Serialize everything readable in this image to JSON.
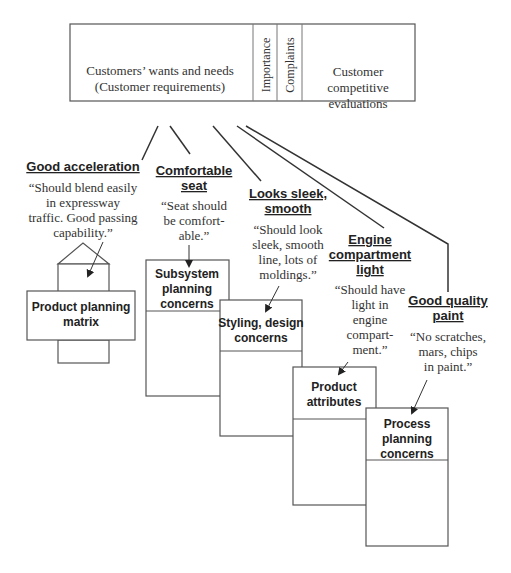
{
  "header_table": {
    "requirements_label_line1": "Customers’ wants and needs",
    "requirements_label_line2": "(Customer requirements)",
    "importance_label": "Importance",
    "complaints_label": "Complaints",
    "evaluations_line1": "Customer",
    "evaluations_line2": "competitive",
    "evaluations_line3": "evaluations"
  },
  "requirements": [
    {
      "title_lines": [
        "Good acceleration"
      ],
      "quote_lines": [
        "“Should blend easily",
        "in expressway",
        "traffic. Good passing",
        "capability.”"
      ]
    },
    {
      "title_lines": [
        "Comfortable",
        "seat"
      ],
      "quote_lines": [
        "“Seat should",
        "be comfort-",
        "able.”"
      ]
    },
    {
      "title_lines": [
        "Looks sleek,",
        "smooth"
      ],
      "quote_lines": [
        "“Should look",
        "sleek, smooth",
        "line, lots of",
        "moldings.”"
      ]
    },
    {
      "title_lines": [
        "Engine",
        "compartment",
        "light"
      ],
      "quote_lines": [
        "“Should have",
        "light in",
        "engine",
        "compart-",
        "ment.”"
      ]
    },
    {
      "title_lines": [
        "Good quality",
        "paint"
      ],
      "quote_lines": [
        "“No scratches,",
        "mars, chips",
        "in paint.”"
      ]
    }
  ],
  "stages": [
    {
      "label_lines": [
        "Product planning",
        "matrix"
      ]
    },
    {
      "label_lines": [
        "Subsystem",
        "planning",
        "concerns"
      ]
    },
    {
      "label_lines": [
        "Styling, design",
        "concerns"
      ]
    },
    {
      "label_lines": [
        "Product",
        "attributes"
      ]
    },
    {
      "label_lines": [
        "Process",
        "planning",
        "concerns"
      ]
    }
  ]
}
